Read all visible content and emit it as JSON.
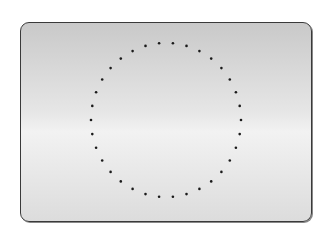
{
  "figure": {
    "shape": "rounded-rectangle-card",
    "border_color": "#3a3a3a",
    "gradient": [
      "#c9c9c9",
      "#e6e6e6",
      "#f2f2f2",
      "#dcdcdc"
    ],
    "dotted_circle": {
      "center_x": 166,
      "center_y": 120,
      "radius_x": 75,
      "radius_y": 77,
      "dot_count": 34,
      "dot_color": "#1a1a1a",
      "dot_radius": 1.3
    }
  }
}
